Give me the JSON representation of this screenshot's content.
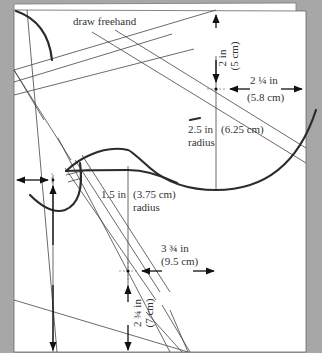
{
  "diagram": {
    "background_color": "#a7a7a7",
    "paper_color": "#ffffff",
    "line_color": "#444444",
    "curve_color": "#2b2b2b",
    "labels": {
      "freehand": "draw freehand",
      "top_vertical_in": "2 in",
      "top_vertical_cm": "(5 cm)",
      "right_horizontal_in": "2 ¼ in",
      "right_horizontal_cm": "(5.8 cm)",
      "large_radius_in": "2.5 in",
      "large_radius_cm": "(6.25 cm)",
      "large_radius_word": "radius",
      "small_radius_in": "1.5 in",
      "small_radius_cm": "(3.75 cm)",
      "small_radius_word": "radius",
      "lower_horizontal_in": "3 ¾ in",
      "lower_horizontal_cm": "(9.5 cm)",
      "lower_vertical_in": "2 ¾ in",
      "lower_vertical_cm": "(7 cm)"
    }
  }
}
